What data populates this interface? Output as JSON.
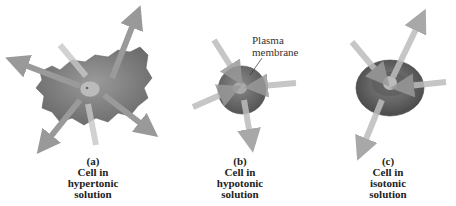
{
  "figure": {
    "panels": [
      {
        "letter": "(a)",
        "line1": "Cell in",
        "line2": "hypertonic",
        "line3": "solution"
      },
      {
        "letter": "(b)",
        "line1": "Cell in",
        "line2": "hypotonic",
        "line3": "solution"
      },
      {
        "letter": "(c)",
        "line1": "Cell in",
        "line2": "isotonic",
        "line3": "solution"
      }
    ],
    "annotation": {
      "line1": "Plasma",
      "line2": "membrane"
    }
  }
}
